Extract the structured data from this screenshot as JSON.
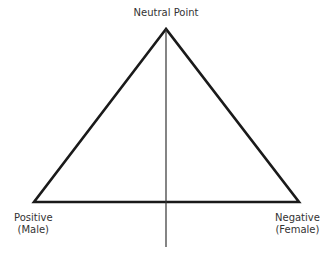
{
  "diagram": {
    "type": "triangle-scale",
    "labels": {
      "top": "Neutral Point",
      "left_line1": "Positive",
      "left_line2": "(Male)",
      "right_line1": "Negative",
      "right_line2": "(Female)"
    },
    "colors": {
      "stroke": "#1a1a1a",
      "text": "#333333",
      "background": "#ffffff"
    }
  }
}
